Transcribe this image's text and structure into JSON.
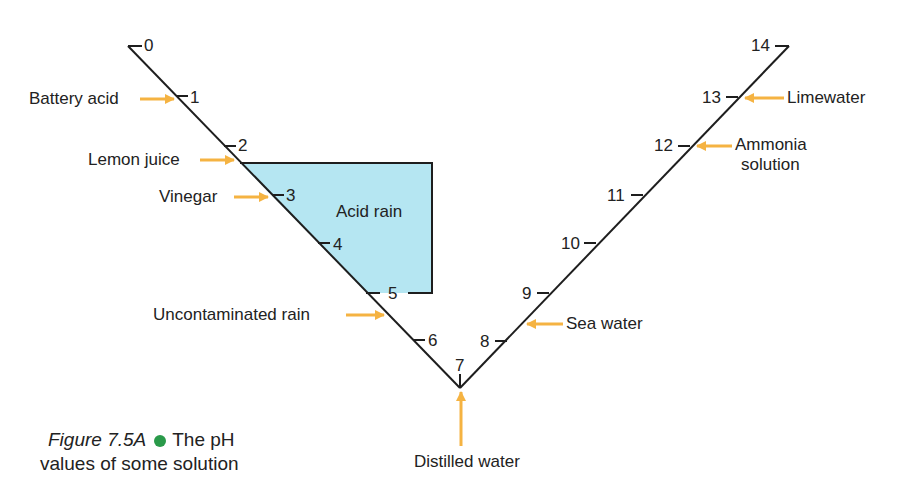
{
  "diagram": {
    "colors": {
      "arrow": "#f5b342",
      "acid_region": "#b5e6f2",
      "line": "#1e1e1e",
      "bullet": "#2a9a4a"
    },
    "scale_ticks": [
      "0",
      "1",
      "2",
      "3",
      "4",
      "5",
      "6",
      "7",
      "8",
      "9",
      "10",
      "11",
      "12",
      "13",
      "14"
    ],
    "region_label": "Acid rain",
    "substances": [
      {
        "label": "Battery acid",
        "ph": "1"
      },
      {
        "label": "Lemon juice",
        "ph": "2.2"
      },
      {
        "label": "Vinegar",
        "ph": "3"
      },
      {
        "label": "Uncontaminated rain",
        "ph": "5.6"
      },
      {
        "label": "Distilled water",
        "ph": "7"
      },
      {
        "label": "Sea water",
        "ph": "8.3"
      },
      {
        "label": "Ammonia solution",
        "label_line1": "Ammonia",
        "label_line2": "solution",
        "ph": "12"
      },
      {
        "label": "Limewater",
        "ph": "13"
      }
    ]
  },
  "caption": {
    "figure": "Figure 7.5A",
    "text_line1": "The pH",
    "text_line2": "values of some solution"
  }
}
